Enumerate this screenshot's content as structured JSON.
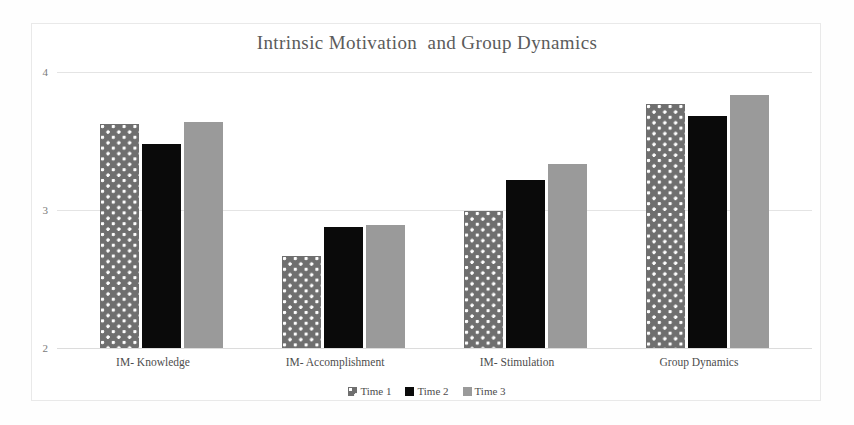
{
  "chart_data": {
    "type": "bar",
    "title": "Intrinsic Motivation  and Group Dynamics",
    "xlabel": "",
    "ylabel": "",
    "ylim": [
      2,
      4
    ],
    "yticks": [
      "2",
      "3",
      "4"
    ],
    "grid": true,
    "legend_position": "bottom",
    "categories": [
      "IM- Knowledge",
      "IM- Accomplishment",
      "IM- Stimulation",
      "Group Dynamics"
    ],
    "series": [
      {
        "name": "Time 1",
        "fill": "dotted-gray",
        "color": "#6f6f6f",
        "values": [
          3.62,
          2.67,
          2.99,
          3.77
        ]
      },
      {
        "name": "Time 2",
        "fill": "solid-black",
        "color": "#0a0a0a",
        "values": [
          3.48,
          2.88,
          3.22,
          3.68
        ]
      },
      {
        "name": "Time 3",
        "fill": "solid-gray",
        "color": "#9a9a9a",
        "values": [
          3.64,
          2.89,
          3.33,
          3.83
        ]
      }
    ]
  },
  "axis": {
    "tick_4": "4",
    "tick_3": "3",
    "tick_2": "2"
  },
  "categories": {
    "c0": "IM- Knowledge",
    "c1": "IM- Accomplishment",
    "c2": "IM- Stimulation",
    "c3": "Group Dynamics"
  },
  "legend": {
    "items": [
      {
        "label": "Time 1"
      },
      {
        "label": "Time 2"
      },
      {
        "label": "Time 3"
      }
    ]
  }
}
